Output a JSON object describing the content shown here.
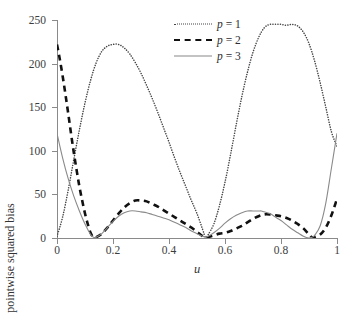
{
  "chart_data": {
    "type": "line",
    "title": "",
    "xlabel": "u",
    "ylabel": "pointwise squared bias",
    "xlim": [
      0,
      1
    ],
    "ylim": [
      0,
      250
    ],
    "grid": false,
    "legend_position": "top-center",
    "xticks": [
      "0",
      "0.2",
      "0.4",
      "0.6",
      "0.8",
      "1"
    ],
    "xtick_values": [
      0,
      0.2,
      0.4,
      0.6,
      0.8,
      1
    ],
    "yticks": [
      "0",
      "50",
      "100",
      "150",
      "200",
      "250"
    ],
    "ytick_values": [
      0,
      50,
      100,
      150,
      200,
      250
    ],
    "series": [
      {
        "name": "p = 1",
        "legend_label": "p = 1",
        "style": "dotted",
        "color": "#444444",
        "x": [
          0.0,
          0.02,
          0.04,
          0.06,
          0.08,
          0.1,
          0.12,
          0.14,
          0.16,
          0.18,
          0.2,
          0.22,
          0.24,
          0.26,
          0.28,
          0.3,
          0.32,
          0.34,
          0.36,
          0.38,
          0.4,
          0.42,
          0.44,
          0.46,
          0.48,
          0.5,
          0.52,
          0.53,
          0.54,
          0.56,
          0.58,
          0.6,
          0.62,
          0.64,
          0.66,
          0.68,
          0.7,
          0.72,
          0.74,
          0.76,
          0.78,
          0.8,
          0.82,
          0.84,
          0.86,
          0.88,
          0.9,
          0.92,
          0.94,
          0.96,
          0.98,
          1.0
        ],
        "values": [
          2,
          24,
          55,
          90,
          124,
          155,
          181,
          201,
          214,
          220,
          222,
          222,
          218,
          211,
          201,
          189,
          175,
          160,
          144,
          127,
          110,
          92,
          75,
          59,
          43,
          28,
          10,
          1,
          4,
          16,
          37,
          64,
          96,
          130,
          162,
          190,
          213,
          230,
          241,
          245,
          245,
          245,
          244,
          245,
          243,
          236,
          223,
          203,
          178,
          150,
          122,
          105
        ]
      },
      {
        "name": "p = 2",
        "legend_label": "p = 2",
        "style": "dashed",
        "color": "#111111",
        "x": [
          0.0,
          0.01,
          0.02,
          0.03,
          0.04,
          0.05,
          0.06,
          0.07,
          0.08,
          0.09,
          0.1,
          0.11,
          0.12,
          0.13,
          0.14,
          0.16,
          0.18,
          0.2,
          0.22,
          0.24,
          0.26,
          0.28,
          0.3,
          0.32,
          0.34,
          0.36,
          0.38,
          0.4,
          0.42,
          0.44,
          0.46,
          0.48,
          0.5,
          0.52,
          0.53,
          0.54,
          0.56,
          0.58,
          0.6,
          0.62,
          0.64,
          0.66,
          0.68,
          0.7,
          0.72,
          0.74,
          0.76,
          0.78,
          0.8,
          0.82,
          0.84,
          0.86,
          0.88,
          0.9,
          0.91,
          0.92,
          0.94,
          0.96,
          0.98,
          1.0
        ],
        "values": [
          222,
          205,
          186,
          165,
          143,
          120,
          98,
          78,
          59,
          43,
          28,
          16,
          6,
          1,
          1,
          5,
          12,
          20,
          28,
          35,
          40,
          43,
          43,
          42,
          39,
          36,
          32,
          28,
          24,
          20,
          16,
          12,
          7,
          2,
          0,
          1,
          3,
          5,
          6,
          8,
          11,
          14,
          18,
          22,
          25,
          27,
          27,
          26,
          25,
          23,
          20,
          16,
          11,
          4,
          1,
          1,
          4,
          12,
          26,
          45
        ]
      },
      {
        "name": "p = 3",
        "legend_label": "p = 3",
        "style": "solid",
        "color": "#8a8a8a",
        "x": [
          0.0,
          0.02,
          0.04,
          0.06,
          0.08,
          0.1,
          0.12,
          0.13,
          0.14,
          0.16,
          0.18,
          0.2,
          0.22,
          0.24,
          0.26,
          0.28,
          0.3,
          0.32,
          0.34,
          0.36,
          0.38,
          0.4,
          0.42,
          0.44,
          0.46,
          0.48,
          0.5,
          0.52,
          0.53,
          0.54,
          0.56,
          0.58,
          0.6,
          0.62,
          0.64,
          0.66,
          0.68,
          0.7,
          0.72,
          0.73,
          0.74,
          0.76,
          0.78,
          0.8,
          0.82,
          0.84,
          0.86,
          0.88,
          0.9,
          0.91,
          0.92,
          0.94,
          0.96,
          0.98,
          1.0
        ],
        "values": [
          120,
          92,
          68,
          48,
          31,
          16,
          4,
          1,
          1,
          5,
          12,
          19,
          25,
          29,
          31,
          31,
          30,
          29,
          27,
          25,
          23,
          21,
          18,
          15,
          12,
          8,
          5,
          2,
          1,
          2,
          6,
          11,
          17,
          22,
          26,
          29,
          31,
          31,
          31,
          31,
          30,
          28,
          24,
          20,
          15,
          10,
          6,
          2,
          0,
          1,
          3,
          14,
          40,
          80,
          120
        ]
      }
    ]
  },
  "axes": {
    "y_title": "pointwise squared bias",
    "x_title": "u"
  },
  "colors": {
    "axis": "#8a8a8a",
    "text": "#3d3d3d",
    "dotted_series": "#444444",
    "dashed_series": "#111111",
    "solid_series": "#8a8a8a",
    "background": "#ffffff"
  }
}
